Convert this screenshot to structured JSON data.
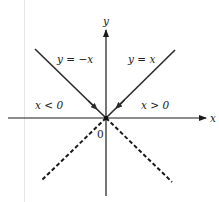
{
  "diagram": {
    "type": "coordinate-graph",
    "axes": {
      "x_label": "x",
      "y_label": "y",
      "origin_label": "0"
    },
    "lines": [
      {
        "equation_label": "y = −x",
        "region": "x < 0",
        "style": "solid"
      },
      {
        "equation_label": "y = x",
        "region": "x > 0",
        "style": "solid"
      },
      {
        "style": "dashed",
        "quadrant": "lower-left"
      },
      {
        "style": "dashed",
        "quadrant": "lower-right"
      }
    ],
    "region_labels": {
      "left": "x < 0",
      "right": "x > 0"
    },
    "colors": {
      "line": "#2b2b2b",
      "axis": "#1a1a1a",
      "background": "#ffffff"
    }
  }
}
